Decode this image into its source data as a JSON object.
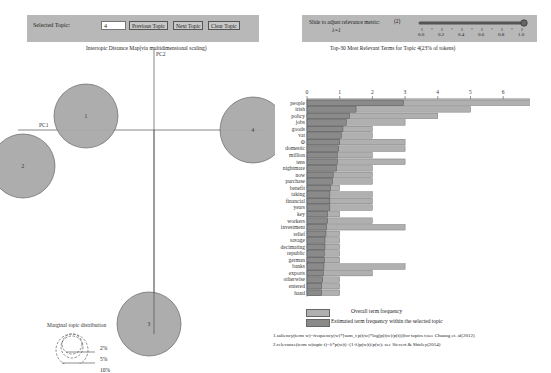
{
  "controls": {
    "selected_topic_label": "Selected Topic:",
    "selected_topic_value": "4",
    "previous_topic": "Previous Topic",
    "next_topic": "Next Topic",
    "clear_topic": "Clear Topic"
  },
  "slider": {
    "label_line1": "Slide to adjust relevance metric:",
    "label_line2": "λ=1",
    "footnote_marker": "(2)",
    "value": 1.0,
    "ticks": [
      "0.0",
      "0.2",
      "0.4",
      "0.6",
      "0.8",
      "1.0"
    ]
  },
  "left": {
    "title": "Intertopic Distance Map(via multidimensional scaling)",
    "pc1_label": "PC1",
    "pc2_label": "PC2",
    "topics": [
      {
        "id": "1",
        "cx": 86,
        "cy": 72,
        "r": 32
      },
      {
        "id": "2",
        "cx": 23,
        "cy": 122,
        "r": 32
      },
      {
        "id": "3",
        "cx": 149,
        "cy": 280,
        "r": 32
      },
      {
        "id": "4",
        "cx": 253,
        "cy": 86,
        "r": 33
      }
    ],
    "legend": {
      "title": "Marginal topic distribution",
      "items": [
        "2%",
        "5%",
        "10%"
      ]
    }
  },
  "right": {
    "title": "Top-30 Most Relevant Terms for Topic 4(23% of tokens)",
    "legend_overall": "Overall term frequency",
    "legend_estimated": "Estimated term frequency within the selected topic",
    "footnote1": "1.saliency(term w)=frequency(w)*[sum_t p(t|w)*log(p(t|w)/p(t))]for topics t;see Chuang et. al(2012)",
    "footnote2": "2.relevance(term w|topic t)=λ*p(w|t)+(1-λ)p(w|t)/p(w); see Sievert & Shirley(2014)"
  },
  "colors": {
    "panel_bg": "#b8b8b8",
    "circle_fill": "#a9a9a9",
    "overall_bar": "#b0b0b0",
    "estimated_bar": "#8a8a8a"
  },
  "chart_data": [
    {
      "type": "scatter",
      "title": "Intertopic Distance Map(via multidimensional scaling)",
      "xlabel": "PC1",
      "ylabel": "PC2",
      "points": [
        {
          "topic": 1,
          "label": "1"
        },
        {
          "topic": 2,
          "label": "2"
        },
        {
          "topic": 3,
          "label": "3"
        },
        {
          "topic": 4,
          "label": "4",
          "selected": true
        }
      ],
      "legend": {
        "title": "Marginal topic distribution",
        "sizes": [
          "2%",
          "5%",
          "10%"
        ]
      }
    },
    {
      "type": "bar",
      "orientation": "horizontal",
      "title": "Top-30 Most Relevant Terms for Topic 4(23% of tokens)",
      "xlim": [
        0,
        7
      ],
      "xticks": [
        0,
        1,
        2,
        3,
        4,
        5,
        6,
        7
      ],
      "categories": [
        "people",
        "irish",
        "policy",
        "jobs",
        "goods",
        "vat",
        "Ф",
        "domestic",
        "million",
        "tens",
        "nightmare",
        "now",
        "purchase",
        "benefit",
        "taking",
        "financial",
        "years",
        "key",
        "workers",
        "investment",
        "relief",
        "savage",
        "decimating",
        "republic",
        "german",
        "banks",
        "exports",
        "otherwise",
        "entered",
        "hand"
      ],
      "series": [
        {
          "name": "Overall term frequency",
          "values": [
            7,
            5,
            4,
            3,
            2,
            2,
            3,
            3,
            2,
            3,
            2,
            2,
            2,
            1,
            2,
            2,
            2,
            1,
            2,
            3,
            1,
            1,
            1,
            1,
            1,
            3,
            2,
            1,
            1,
            1
          ]
        },
        {
          "name": "Estimated term frequency within the selected topic",
          "values": [
            2.95,
            1.5,
            1.3,
            1.2,
            1.1,
            1.05,
            1.0,
            0.97,
            0.93,
            0.93,
            0.9,
            0.8,
            0.78,
            0.72,
            0.7,
            0.7,
            0.7,
            0.63,
            0.63,
            0.6,
            0.58,
            0.55,
            0.55,
            0.53,
            0.53,
            0.52,
            0.5,
            0.48,
            0.45,
            0.45
          ]
        }
      ],
      "legend_position": "bottom"
    }
  ]
}
